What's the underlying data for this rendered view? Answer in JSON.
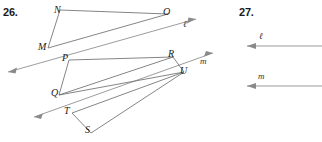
{
  "page": {
    "width": 322,
    "height": 142,
    "background": "#ffffff",
    "ink_color": "#6f6f6f",
    "label_color": "#1a1a1a"
  },
  "problems": [
    {
      "number": "26.",
      "figure": {
        "description": "Two transversal lines l and m cut by segments forming quadrilaterals NMQO and PQUR with triangle TSU",
        "points": [
          {
            "name": "N",
            "x": 60,
            "y": 10,
            "label_x": 54,
            "label_y": 5
          },
          {
            "name": "O",
            "x": 168,
            "y": 14,
            "label_x": 163,
            "label_y": 7
          },
          {
            "name": "M",
            "x": 48,
            "y": 48,
            "label_x": 38,
            "label_y": 42
          },
          {
            "name": "P",
            "x": 69,
            "y": 60,
            "label_x": 62,
            "label_y": 53
          },
          {
            "name": "R",
            "x": 173,
            "y": 57,
            "label_x": 168,
            "label_y": 49
          },
          {
            "name": "U",
            "x": 184,
            "y": 72,
            "label_x": 180,
            "label_y": 66
          },
          {
            "name": "Q",
            "x": 59,
            "y": 95,
            "label_x": 51,
            "label_y": 88
          },
          {
            "name": "T",
            "x": 72,
            "y": 113,
            "label_x": 64,
            "label_y": 106
          },
          {
            "name": "S",
            "x": 91,
            "y": 133,
            "label_x": 85,
            "label_y": 125
          }
        ],
        "segments": [
          {
            "name": "segment-NO",
            "from": "N",
            "to": "O"
          },
          {
            "name": "segment-NM",
            "from": "N",
            "to": "M"
          },
          {
            "name": "segment-MO",
            "from": "M",
            "to": "O"
          },
          {
            "name": "segment-PR",
            "from": "P",
            "to": "R"
          },
          {
            "name": "segment-PQ",
            "from": "P",
            "to": "Q"
          },
          {
            "name": "segment-QR",
            "from": "Q",
            "to": "R"
          },
          {
            "name": "segment-QU",
            "from": "Q",
            "to": "U"
          },
          {
            "name": "segment-RU",
            "from": "R",
            "to": "U"
          },
          {
            "name": "segment-TU",
            "from": "T",
            "to": "U"
          },
          {
            "name": "segment-TS",
            "from": "T",
            "to": "S"
          },
          {
            "name": "segment-SU",
            "from": "S",
            "to": "U"
          }
        ],
        "lines": [
          {
            "name": "line-l",
            "label": "ℓ",
            "label_x": 183,
            "label_y": 20,
            "x1": 8,
            "y1": 72,
            "x2": 196,
            "y2": 19,
            "arrows": "both"
          },
          {
            "name": "line-m",
            "label": "m",
            "label_x": 200,
            "label_y": 57,
            "x1": 34,
            "y1": 117,
            "x2": 213,
            "y2": 53,
            "arrows": "both"
          }
        ]
      }
    },
    {
      "number": "27.",
      "figure": {
        "description": "Two parallel horizontal rays labeled l and m pointing left",
        "lines": [
          {
            "name": "line-l",
            "label": "ℓ",
            "label_x": 259,
            "label_y": 32,
            "x1": 247,
            "y1": 46,
            "x2": 322,
            "y2": 46,
            "arrows": "left"
          },
          {
            "name": "line-m",
            "label": "m",
            "label_x": 258,
            "label_y": 72,
            "x1": 247,
            "y1": 86,
            "x2": 322,
            "y2": 86,
            "arrows": "left"
          }
        ]
      }
    }
  ]
}
